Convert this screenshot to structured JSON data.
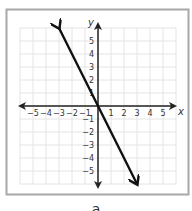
{
  "chart_data": {
    "type": "line",
    "title": "",
    "xlabel": "x",
    "ylabel": "y",
    "xlim": [
      -5,
      5
    ],
    "ylim": [
      -5,
      5
    ],
    "grid": true,
    "x_ticks": [
      "-5",
      "-4",
      "-3",
      "-2",
      "-1",
      "1",
      "2",
      "3",
      "4",
      "5"
    ],
    "y_ticks": [
      "5",
      "4",
      "3",
      "2",
      "1",
      "-1",
      "-2",
      "-3",
      "-4",
      "-5"
    ],
    "series": [
      {
        "name": "line",
        "equation": "y = -2x",
        "slope": -2,
        "intercept": 0,
        "x": [
          -3,
          3
        ],
        "y": [
          6,
          -6
        ],
        "arrows_both_ends": true
      }
    ]
  },
  "caption": "a",
  "colors": {
    "frame": "#a8a8a8",
    "grid": "#e4e4e4",
    "axis": "#222222",
    "line": "#111111"
  }
}
